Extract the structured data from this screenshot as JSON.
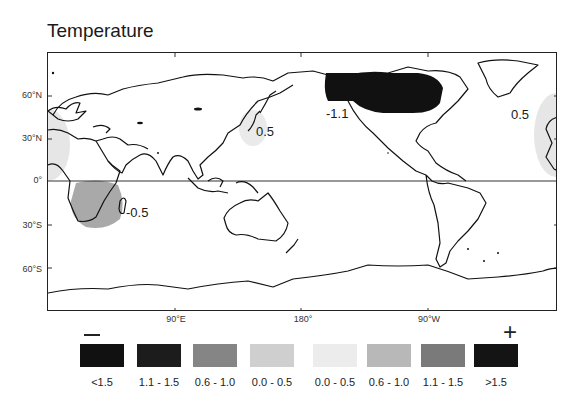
{
  "title": "Temperature",
  "map": {
    "latitude_labels": [
      "60°N",
      "30°N",
      "0°",
      "30°S",
      "60°S"
    ],
    "longitude_labels": [
      "90°E",
      "180°",
      "90°W"
    ],
    "anomaly_annotations": [
      {
        "label": "-1.1",
        "region": "North Pacific / Alaska",
        "shade": "dark"
      },
      {
        "label": "0.5",
        "region": "Japan / Northwest Pacific",
        "shade": "light"
      },
      {
        "label": "0.5",
        "region": "Western Europe / North Africa",
        "shade": "light"
      },
      {
        "label": "-0.5",
        "region": "Southern Africa",
        "shade": "medium"
      }
    ]
  },
  "legend": {
    "negative_sign": "—",
    "positive_sign": "+",
    "items": [
      {
        "label": "<1.5",
        "color": "#111111"
      },
      {
        "label": "1.1 - 1.5",
        "color": "#1c1c1c"
      },
      {
        "label": "0.6 - 1.0",
        "color": "#858585"
      },
      {
        "label": "0.0 - 0.5",
        "color": "#cfcfcf"
      },
      {
        "label": "0.0 - 0.5",
        "color": "#ececec"
      },
      {
        "label": "0.6 - 1.0",
        "color": "#b8b8b8"
      },
      {
        "label": "1.1 - 1.5",
        "color": "#7a7a7a"
      },
      {
        "label": ">1.5",
        "color": "#141414"
      }
    ]
  }
}
